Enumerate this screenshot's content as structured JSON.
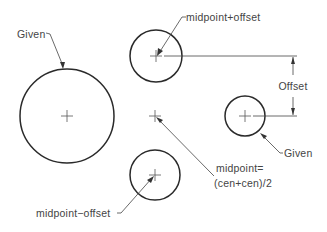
{
  "diagram": {
    "colors": {
      "background": "#ffffff",
      "stroke": "#2a2a2a",
      "text": "#444444"
    },
    "labels": {
      "given_left": "Given",
      "given_right": "Given",
      "midpoint_plus_offset": "midpoint+offset",
      "midpoint_minus_offset": "midpoint−offset",
      "midpoint_eq_line1": "midpoint=",
      "midpoint_eq_line2": "(cen+cen)/2",
      "offset_dimension": "Offset"
    },
    "shapes": [
      {
        "id": "given-circle-large",
        "cx": 67,
        "cy": 116,
        "r": 47
      },
      {
        "id": "offset-circle-top",
        "cx": 156,
        "cy": 56,
        "r": 26
      },
      {
        "id": "given-circle-small",
        "cx": 245,
        "cy": 116,
        "r": 20
      },
      {
        "id": "offset-circle-bottom",
        "cx": 155,
        "cy": 175,
        "r": 25
      },
      {
        "id": "midpoint-marker",
        "cx": 155,
        "cy": 116
      }
    ]
  }
}
